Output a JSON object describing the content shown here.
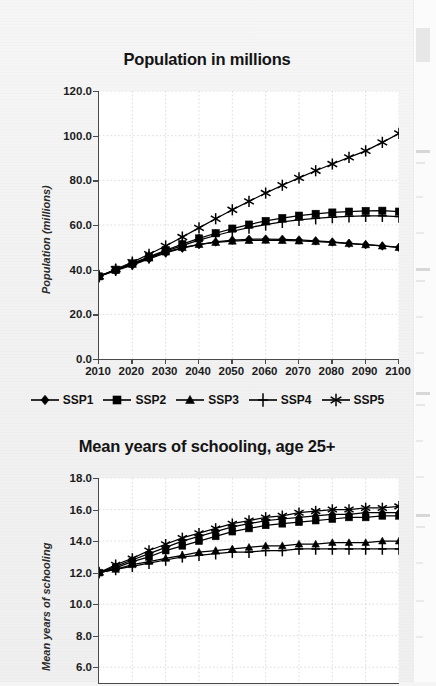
{
  "page": {
    "background_color": "#f2f2f2",
    "paper_color": "#ffffff"
  },
  "legend": {
    "items": [
      {
        "label": "SSP1",
        "marker": "diamond-marker-icon"
      },
      {
        "label": "SSP2",
        "marker": "square-marker-icon"
      },
      {
        "label": "SSP3",
        "marker": "triangle-marker-icon"
      },
      {
        "label": "SSP4",
        "marker": "plus-marker-icon"
      },
      {
        "label": "SSP5",
        "marker": "asterisk-marker-icon"
      }
    ]
  },
  "chart_data": [
    {
      "id": "population-chart",
      "type": "line",
      "title": "Population in millions",
      "xlabel": "",
      "ylabel": "Population (millions)",
      "x": [
        2010,
        2015,
        2020,
        2025,
        2030,
        2035,
        2040,
        2045,
        2050,
        2055,
        2060,
        2065,
        2070,
        2075,
        2080,
        2085,
        2090,
        2095,
        2100
      ],
      "xticks": [
        2010,
        2020,
        2030,
        2040,
        2050,
        2060,
        2070,
        2080,
        2090,
        2100
      ],
      "xticklabels": [
        "2010",
        "2020",
        "2030",
        "2040",
        "2050",
        "2060",
        "2070",
        "2080",
        "2090",
        "2100"
      ],
      "xlim": [
        2010,
        2100
      ],
      "ylim": [
        0,
        120
      ],
      "yticks": [
        0,
        20,
        40,
        60,
        80,
        100,
        120
      ],
      "yticklabels": [
        "0.0",
        "20.0",
        "40.0",
        "60.0",
        "80.0",
        "100.0",
        "120.0"
      ],
      "grid": true,
      "legend_position": "below",
      "series": [
        {
          "name": "SSP1",
          "marker": "diamond",
          "values": [
            37.0,
            39.5,
            42.0,
            44.8,
            47.5,
            49.6,
            51.2,
            52.4,
            53.2,
            53.6,
            53.7,
            53.6,
            53.3,
            52.9,
            52.4,
            51.8,
            51.2,
            50.6,
            50.0
          ]
        },
        {
          "name": "SSP2",
          "marker": "square",
          "values": [
            37.0,
            40.0,
            42.8,
            45.8,
            48.7,
            51.4,
            54.0,
            56.3,
            58.4,
            60.2,
            61.8,
            63.1,
            64.2,
            65.0,
            65.6,
            66.0,
            66.3,
            66.4,
            66.0
          ]
        },
        {
          "name": "SSP3",
          "marker": "triangle",
          "values": [
            37.0,
            39.8,
            42.4,
            45.2,
            47.9,
            49.9,
            51.3,
            52.2,
            52.8,
            53.1,
            53.2,
            53.1,
            52.9,
            52.6,
            52.2,
            51.7,
            51.2,
            50.6,
            50.0
          ]
        },
        {
          "name": "SSP4",
          "marker": "plus",
          "values": [
            37.0,
            39.9,
            42.6,
            45.5,
            48.3,
            50.8,
            53.2,
            55.3,
            57.2,
            58.8,
            60.2,
            61.4,
            62.3,
            63.0,
            63.5,
            63.9,
            64.1,
            64.1,
            63.8
          ]
        },
        {
          "name": "SSP5",
          "marker": "asterisk",
          "values": [
            37.0,
            40.2,
            43.4,
            46.9,
            50.6,
            54.6,
            58.7,
            62.8,
            66.8,
            70.6,
            74.3,
            77.8,
            81.1,
            84.3,
            87.3,
            90.3,
            93.2,
            97.0,
            101.0
          ]
        }
      ]
    },
    {
      "id": "schooling-chart",
      "type": "line",
      "title": "Mean years of schooling, age 25+",
      "xlabel": "",
      "ylabel": "Mean years of schooling",
      "x": [
        2010,
        2015,
        2020,
        2025,
        2030,
        2035,
        2040,
        2045,
        2050,
        2055,
        2060,
        2065,
        2070,
        2075,
        2080,
        2085,
        2090,
        2095,
        2100
      ],
      "xticks": [
        2010,
        2020,
        2030,
        2040,
        2050,
        2060,
        2070,
        2080,
        2090,
        2100
      ],
      "xticklabels": [
        "2010",
        "2020",
        "2030",
        "2040",
        "2050",
        "2060",
        "2070",
        "2080",
        "2090",
        "2100"
      ],
      "xlim": [
        2010,
        2100
      ],
      "ylim": [
        5.0,
        18.0
      ],
      "yticks": [
        6,
        8,
        10,
        12,
        14,
        16,
        18
      ],
      "yticklabels": [
        "6.0",
        "8.0",
        "10.0",
        "12.0",
        "14.0",
        "16.0",
        "18.0"
      ],
      "grid": true,
      "legend_position": "none",
      "series": [
        {
          "name": "SSP1",
          "marker": "diamond",
          "values": [
            12.0,
            12.4,
            12.8,
            13.2,
            13.6,
            14.0,
            14.3,
            14.6,
            14.9,
            15.1,
            15.3,
            15.4,
            15.5,
            15.6,
            15.7,
            15.7,
            15.8,
            15.8,
            15.8
          ]
        },
        {
          "name": "SSP2",
          "marker": "square",
          "values": [
            12.0,
            12.3,
            12.7,
            13.0,
            13.4,
            13.7,
            14.0,
            14.3,
            14.6,
            14.8,
            15.0,
            15.1,
            15.2,
            15.3,
            15.4,
            15.5,
            15.5,
            15.6,
            15.6
          ]
        },
        {
          "name": "SSP3",
          "marker": "triangle",
          "values": [
            12.0,
            12.2,
            12.5,
            12.7,
            12.9,
            13.1,
            13.3,
            13.4,
            13.5,
            13.6,
            13.7,
            13.7,
            13.8,
            13.8,
            13.9,
            13.9,
            13.9,
            14.0,
            14.0
          ]
        },
        {
          "name": "SSP4",
          "marker": "plus",
          "values": [
            12.0,
            12.2,
            12.4,
            12.6,
            12.8,
            13.0,
            13.1,
            13.2,
            13.3,
            13.3,
            13.4,
            13.4,
            13.5,
            13.5,
            13.5,
            13.5,
            13.5,
            13.5,
            13.5
          ]
        },
        {
          "name": "SSP5",
          "marker": "asterisk",
          "values": [
            12.0,
            12.5,
            12.9,
            13.4,
            13.8,
            14.2,
            14.5,
            14.8,
            15.1,
            15.3,
            15.5,
            15.6,
            15.8,
            15.9,
            16.0,
            16.0,
            16.1,
            16.1,
            16.2
          ]
        }
      ]
    }
  ]
}
